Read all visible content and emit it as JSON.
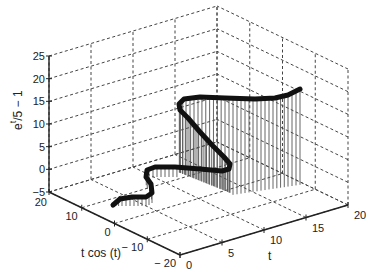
{
  "chart_data": {
    "type": "stem3",
    "title": "",
    "xlabel": "t",
    "ylabel": "t cos (t)",
    "zlabel": "e^t/5 − 1",
    "zlabel_parts": {
      "base": "e",
      "sup": "t",
      "rest": "/5 − 1"
    },
    "x_axis": {
      "name": "t",
      "range": [
        0,
        20
      ],
      "ticks": [
        0,
        5,
        10,
        15,
        20
      ],
      "tick_labels": [
        "0",
        "5",
        "10",
        "15",
        "20"
      ]
    },
    "y_axis": {
      "name": "t cos (t)",
      "range": [
        -20,
        20
      ],
      "ticks": [
        -20,
        -10,
        0,
        10,
        20
      ],
      "tick_labels": [
        "− 20",
        "− 10",
        "0",
        "10",
        "20"
      ]
    },
    "z_axis": {
      "name": "e^t/5 − 1",
      "range": [
        -5,
        25
      ],
      "ticks": [
        -5,
        0,
        5,
        10,
        15,
        20,
        25
      ],
      "tick_labels": [
        "−5",
        "0",
        "5",
        "10",
        "15",
        "20",
        "25"
      ]
    },
    "grid": true,
    "grid_style": "dashed",
    "box": false,
    "series": [
      {
        "name": "3-D helix stem plot",
        "style": "stems with thick marker line",
        "curve_trace_px": [
          [
            113,
            205
          ],
          [
            120,
            199
          ],
          [
            132,
            197
          ],
          [
            146,
            197
          ],
          [
            152,
            193
          ],
          [
            151,
            184
          ],
          [
            146,
            177
          ],
          [
            147,
            170
          ],
          [
            155,
            167
          ],
          [
            175,
            167
          ],
          [
            200,
            169
          ],
          [
            222,
            171
          ],
          [
            229,
            169
          ],
          [
            230,
            164
          ],
          [
            224,
            157
          ],
          [
            213,
            146
          ],
          [
            200,
            132
          ],
          [
            188,
            118
          ],
          [
            180,
            110
          ],
          [
            179,
            104
          ],
          [
            184,
            99
          ],
          [
            200,
            97
          ],
          [
            225,
            98
          ],
          [
            255,
            99
          ],
          [
            275,
            98
          ],
          [
            288,
            95
          ],
          [
            296,
            91
          ],
          [
            300,
            89
          ]
        ],
        "stem_base_trace_px": [
          [
            140,
            205
          ],
          [
            165,
            203
          ],
          [
            200,
            200
          ],
          [
            228,
            197
          ],
          [
            228,
            172
          ],
          [
            182,
            160
          ],
          [
            182,
            115
          ],
          [
            230,
            175
          ],
          [
            298,
            185
          ]
        ]
      }
    ],
    "colors": {
      "line": "#111111",
      "stems": "#555555",
      "grid": "#444444",
      "axis": "#222222"
    }
  }
}
